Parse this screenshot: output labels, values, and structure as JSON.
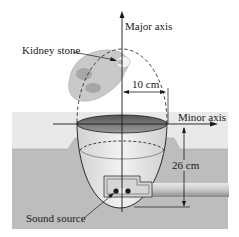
{
  "figure": {
    "labels": {
      "major_axis": "Major axis",
      "minor_axis": "Minor axis",
      "kidney_stone": "Kidney stone",
      "sound_source": "Sound source",
      "semi_minor_dimension": "10 cm",
      "focal_depth_dimension": "26 cm"
    },
    "colors": {
      "background": "#ffffff",
      "water_surface": "#e4e4e4",
      "tub_base": "#bdbdbd",
      "line": "#1a1a1a",
      "kidney": "#b9b9b9",
      "pipe": "#cfcfcf"
    }
  }
}
